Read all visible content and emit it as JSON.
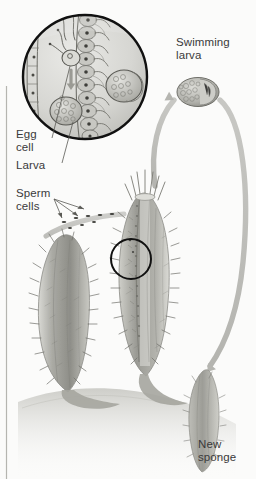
{
  "figure": {
    "background_color": "#fbfbfa",
    "label_color": "#3a3a3a",
    "arrow_color": "#b9b9b6",
    "inset_outline_color": "#111111"
  },
  "labels": {
    "egg_cell": "Egg\ncell",
    "larva": "Larva",
    "sperm_cells": "Sperm\ncells",
    "swimming_larva": "Swimming\nlarva",
    "new_sponge": "New\nsponge"
  },
  "illustration": {
    "inset_circle": {
      "name": "magnified-choanocyte-chamber",
      "cx": 85,
      "cy": 77,
      "r": 63,
      "contents": [
        "choanocyte-cells-row",
        "egg-cell",
        "sperm-cells-with-flagella",
        "developing-larva",
        "embryo-cluster",
        "epithelium-layer",
        "downward-arrow"
      ]
    },
    "sponges": [
      {
        "name": "left-sponge",
        "cx": 68,
        "cy": 310,
        "label": null
      },
      {
        "name": "right-sponge",
        "cx": 140,
        "cy": 285,
        "label": null
      },
      {
        "name": "new-sponge",
        "cx": 205,
        "cy": 405,
        "label": "New sponge"
      }
    ],
    "swimming_larva_blob": {
      "cx": 198,
      "cy": 92,
      "rx": 20,
      "ry": 14
    },
    "arrows": [
      {
        "name": "larva-release-arrow",
        "from": "right-sponge-osculum",
        "to": "swimming-larva"
      },
      {
        "name": "larva-settle-arrow",
        "from": "swimming-larva",
        "to": "new-sponge"
      }
    ],
    "callout_circle": {
      "cx": 131,
      "cy": 259,
      "r": 20
    },
    "left_rule": {
      "x": 6,
      "y1": 86,
      "y2": 479
    },
    "sperm_leader_lines": 3
  }
}
